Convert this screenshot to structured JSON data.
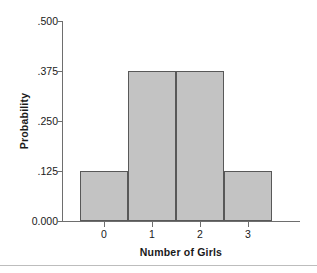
{
  "chart_data": {
    "type": "bar",
    "title": "",
    "subtitle": "",
    "xlabel": "Number of Girls",
    "ylabel": "Probability",
    "categories": [
      "0",
      "1",
      "2",
      "3"
    ],
    "values": [
      0.125,
      0.375,
      0.375,
      0.125
    ],
    "ylim": [
      0.0,
      0.5
    ],
    "yticks": [
      0.0,
      0.125,
      0.25,
      0.375,
      0.5
    ],
    "ytick_labels": [
      "0.000",
      ".125",
      ".250",
      ".375",
      ".500"
    ],
    "xtick_labels": [
      "0",
      "1",
      "2",
      "3"
    ],
    "grid": false,
    "legend": null,
    "legend_position": "none",
    "bar_fill_color": "#c3c3c3",
    "bar_edge_color": "#585858",
    "axis_color": "#6e6e6e",
    "text_color": "#1a1a1a",
    "background_color": "#ffffff",
    "annotations": []
  },
  "figure": {
    "bottom_rule_color": "#bdbdbd"
  }
}
